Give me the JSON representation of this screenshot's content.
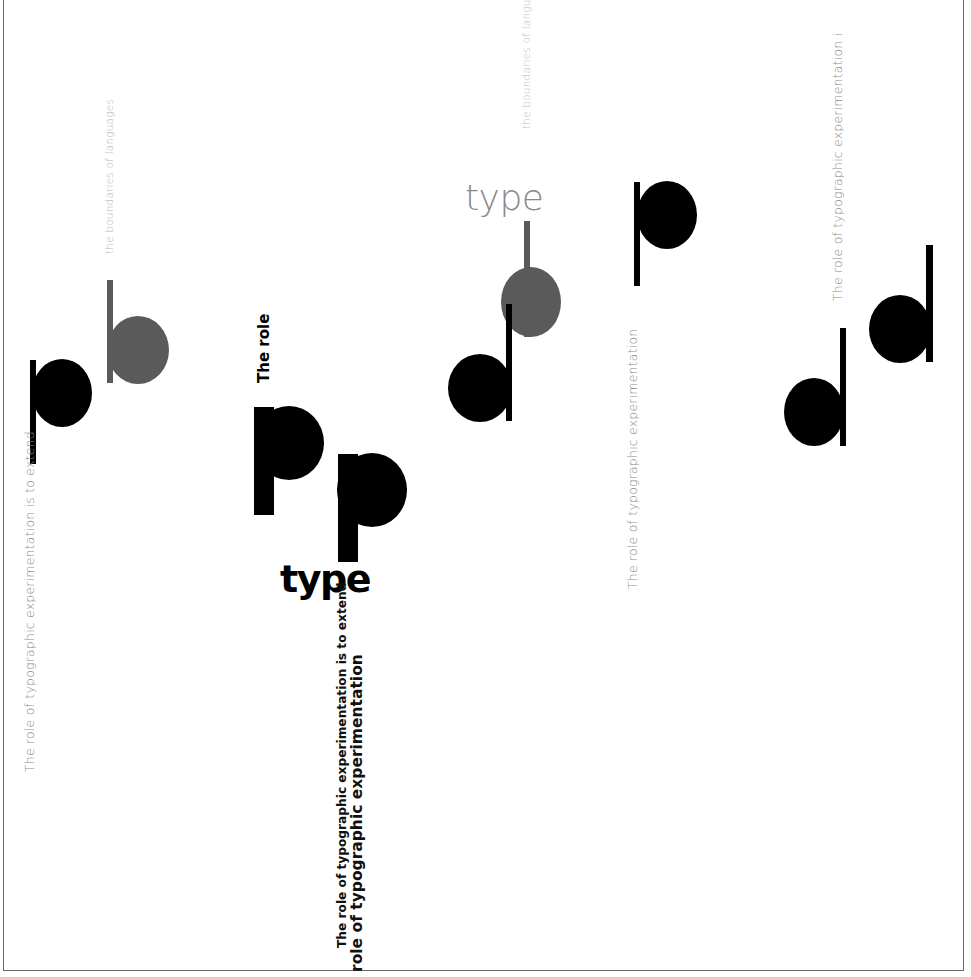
{
  "poster": {
    "colors": {
      "black": "#000000",
      "gray": "#5a5a5a",
      "light_gray": "#b8b8b8",
      "mid_gray": "#8a8a8a",
      "frame": "#6a6a6a",
      "background": "#ffffff"
    },
    "texts": {
      "left_caption": "The role of typographic experimentation is to extend",
      "left_top_caption": "the boundaries of languages",
      "center_the_role": "The role",
      "center_type_bold": "type",
      "center_caption_line1": "The role of typographic experimentation is to extend",
      "center_caption_line2": "role of typographic experimentation",
      "top_type_light": "type",
      "top_boundaries_caption": "the boundaries of langua",
      "mid_right_caption": "The role of typographic experimentation",
      "far_right_caption": "The role of typographic experimentation i"
    },
    "glyphs": [
      {
        "name": "p",
        "color": "black",
        "group": "left-pair"
      },
      {
        "name": "b",
        "color": "gray",
        "group": "left-pair"
      },
      {
        "name": "p",
        "color": "black",
        "group": "center-pair"
      },
      {
        "name": "p",
        "color": "black",
        "group": "center-pair"
      },
      {
        "name": "d",
        "color": "black",
        "group": "top-center-pair"
      },
      {
        "name": "b",
        "color": "gray",
        "group": "top-center-pair"
      },
      {
        "name": "p",
        "color": "black",
        "group": "top-right-single"
      },
      {
        "name": "d",
        "color": "black",
        "group": "right-pair"
      },
      {
        "name": "d",
        "color": "black",
        "group": "right-pair"
      }
    ]
  }
}
